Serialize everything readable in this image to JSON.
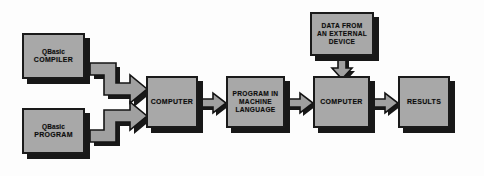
{
  "diagram": {
    "type": "flowchart",
    "background_color": "#fdfdfd",
    "node_fill_color": "#a8a8a8",
    "node_border_color": "#1a1a1a",
    "shadow_color": "#181818",
    "arrow_fill_color": "#a0a0a0",
    "nodes": [
      {
        "id": "compiler",
        "lines": [
          "QBasic",
          "COMPILER"
        ],
        "mixed_case_first_line": true
      },
      {
        "id": "program",
        "lines": [
          "QBasic",
          "PROGRAM"
        ],
        "mixed_case_first_line": true
      },
      {
        "id": "computer1",
        "lines": [
          "COMPUTER"
        ],
        "mixed_case_first_line": false
      },
      {
        "id": "machine",
        "lines": [
          "PROGRAM IN",
          "MACHINE",
          "LANGUAGE"
        ],
        "mixed_case_first_line": false
      },
      {
        "id": "external",
        "lines": [
          "DATA FROM",
          "AN EXTERNAL",
          "DEVICE"
        ],
        "mixed_case_first_line": false
      },
      {
        "id": "computer2",
        "lines": [
          "COMPUTER"
        ],
        "mixed_case_first_line": false
      },
      {
        "id": "results",
        "lines": [
          "RESULTS"
        ],
        "mixed_case_first_line": false
      }
    ],
    "connectors": [
      {
        "id": "elbow-top",
        "from": "compiler",
        "to": "computer1",
        "shape": "elbow-right-down-right",
        "direction": "right"
      },
      {
        "id": "elbow-bot",
        "from": "program",
        "to": "computer1",
        "shape": "elbow-right-up-right",
        "direction": "right"
      },
      {
        "id": "c1-ml",
        "from": "computer1",
        "to": "machine",
        "shape": "straight",
        "direction": "right"
      },
      {
        "id": "ml-c2",
        "from": "machine",
        "to": "computer2",
        "shape": "straight",
        "direction": "right"
      },
      {
        "id": "c2-res",
        "from": "computer2",
        "to": "results",
        "shape": "straight",
        "direction": "right"
      },
      {
        "id": "ext-c2",
        "from": "external",
        "to": "computer2",
        "shape": "straight",
        "direction": "down"
      }
    ]
  }
}
